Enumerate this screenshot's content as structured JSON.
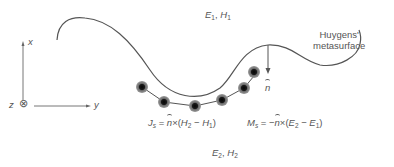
{
  "diagram": {
    "region_top_fields": {
      "e": "E",
      "e_sub": "1",
      "sep": ", ",
      "h": "H",
      "h_sub": "1"
    },
    "region_bottom_fields": {
      "e": "E",
      "e_sub": "2",
      "sep": ", ",
      "h": "H",
      "h_sub": "2"
    },
    "surface_label_line1": "Huygens'",
    "surface_label_line2": "metasurface",
    "normal_label": "n",
    "axes": {
      "x": "x",
      "y": "y",
      "z": "z",
      "z_symbol": "⊗"
    },
    "equation_electric": {
      "lhs": "J",
      "lhs_sub": "s",
      "eq": " = ",
      "n": "n",
      "cross": "×(",
      "a": "H",
      "a_sub": "2",
      "minus": " − ",
      "b": "H",
      "b_sub": "1",
      "close": ")"
    },
    "equation_magnetic": {
      "lhs": "M",
      "lhs_sub": "s",
      "eq": " = −",
      "n": "n",
      "cross": "×(",
      "a": "E",
      "a_sub": "2",
      "minus": " − ",
      "b": "E",
      "b_sub": "1",
      "close": ")"
    },
    "colors": {
      "line": "#555555",
      "dot_core": "#111111",
      "dot_halo": "#8a8a8a"
    }
  }
}
